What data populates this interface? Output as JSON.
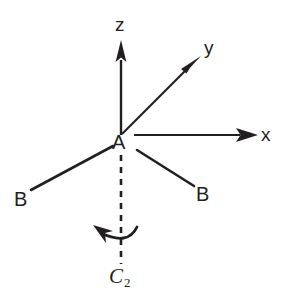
{
  "figure": {
    "background_color": "#ffffff",
    "stroke_color": "#231f20",
    "width": 281,
    "height": 307
  },
  "axes": [
    {
      "name": "z",
      "label": "z",
      "label_x": 116,
      "label_y": 16,
      "tip": [
        120,
        41
      ],
      "origin": [
        122,
        135
      ]
    },
    {
      "name": "y",
      "label": "y",
      "label_x": 205,
      "label_y": 38,
      "tip": [
        201,
        56
      ],
      "origin": [
        122,
        135
      ]
    },
    {
      "name": "x",
      "label": "x",
      "label_x": 262,
      "label_y": 125,
      "tip": [
        258,
        135
      ],
      "origin": [
        134,
        135
      ]
    }
  ],
  "atoms": {
    "center": {
      "label": "A",
      "x": 112,
      "y": 135
    },
    "ligand_left": {
      "label": "B",
      "x": 14,
      "y": 190
    },
    "ligand_right": {
      "label": "B",
      "x": 196,
      "y": 185
    }
  },
  "bonds": [
    {
      "name": "bond-a-b-left",
      "from": [
        113,
        146
      ],
      "to": [
        31,
        190
      ]
    },
    {
      "name": "bond-a-b-right",
      "from": [
        137,
        150
      ],
      "to": [
        194,
        186
      ]
    }
  ],
  "rotation_axis": {
    "name": "c2-axis",
    "label": "C",
    "label_subscript": "2",
    "label_x": 109,
    "label_y": 268,
    "dashed_line": {
      "from": [
        121,
        155
      ],
      "to": [
        121,
        264
      ]
    },
    "dash_pattern": "6 6"
  },
  "rotation_arrow": {
    "name": "c2-rotation-arrow",
    "direction": "counterclockwise",
    "path": "M 136 228 Q 127 245 99 232",
    "arrow_tip": [
      94,
      226
    ]
  }
}
